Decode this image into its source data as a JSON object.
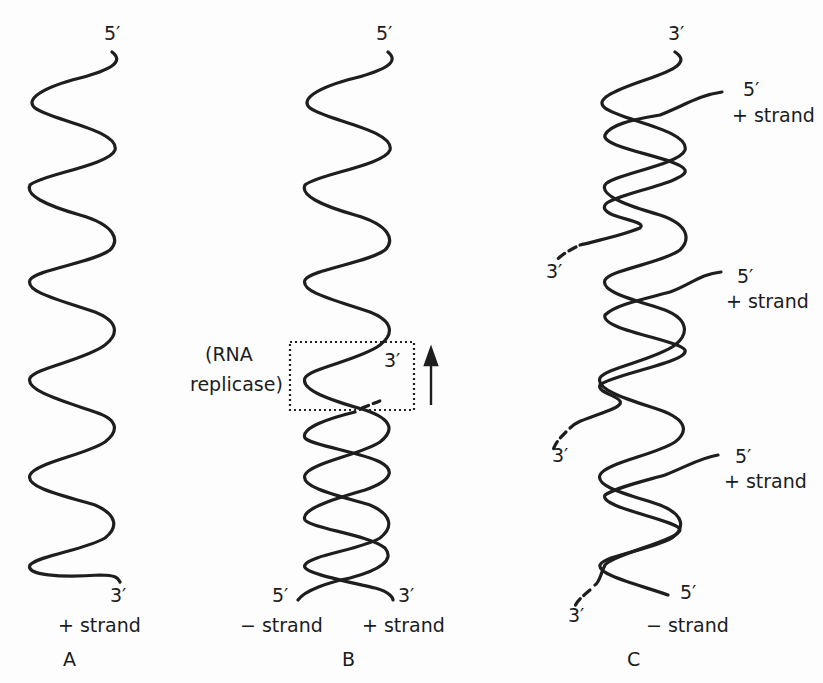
{
  "figure": {
    "panels": [
      {
        "id": "A",
        "label": "A",
        "top_end": "5′",
        "bottom_end": "3′",
        "strand_label": "+ strand"
      },
      {
        "id": "B",
        "label": "B",
        "top_end": "5′",
        "enzyme_label_line1": "(RNA",
        "enzyme_label_line2": "replicase)",
        "growing_end": "3′",
        "direction": "arrow-up",
        "bottom_left_end": "5′",
        "bottom_right_end": "3′",
        "left_strand_label": "− strand",
        "right_strand_label": "+ strand"
      },
      {
        "id": "C",
        "label": "C",
        "top_end": "3′",
        "new_strands": [
          {
            "end5": "5′",
            "strand_label": "+ strand",
            "end3": "3′"
          },
          {
            "end5": "5′",
            "strand_label": "+ strand",
            "end3": "3′"
          },
          {
            "end5": "5′",
            "strand_label": "+ strand",
            "end3": "3′"
          }
        ],
        "bottom_right_end": "5′",
        "bottom_strand_label": "− strand"
      }
    ]
  }
}
